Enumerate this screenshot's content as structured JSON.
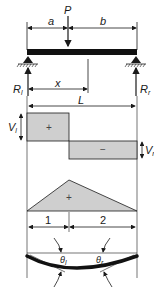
{
  "diagram": {
    "type": "simply-supported beam with point load",
    "labels": {
      "a": "a",
      "b": "b",
      "P": "P",
      "x": "x",
      "L": "L",
      "Rl_main": "R",
      "Rl_sub": "l",
      "Rr_main": "R",
      "Rr_sub": "r",
      "Vl_main": "V",
      "Vl_sub": "l",
      "Vr_main": "V",
      "Vr_sub": "r",
      "shear_pos": "+",
      "shear_neg": "−",
      "moment_pos": "+",
      "seg1": "1",
      "seg2": "2",
      "theta_l_main": "θ",
      "theta_l_sub": "l",
      "theta_r_main": "θ",
      "theta_r_sub": "r"
    },
    "colors": {
      "line": "#1a1a1a",
      "fill": "#cfcfcf",
      "beam": "#111111"
    }
  }
}
